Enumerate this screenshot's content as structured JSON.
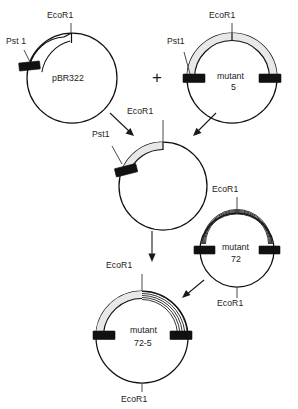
{
  "figure": {
    "operator": "+",
    "colors": {
      "line": "#111111",
      "band_shaded": "#e8e8e8",
      "pst_box": "#111111",
      "background": "#ffffff"
    }
  },
  "plasmids": [
    {
      "id": "pbr322",
      "name": "pBR322",
      "name_line1": "pBR322",
      "name_line2": "",
      "center": {
        "x": 72,
        "y": 78
      },
      "radius": 45,
      "sites": [
        {
          "label": "EcoR1",
          "position": "top"
        },
        {
          "label": "Pst 1",
          "position": "left"
        }
      ],
      "band": {
        "style": "double-line",
        "from": "pst1",
        "to": "ecor1"
      }
    },
    {
      "id": "mutant5",
      "name": "mutant 5",
      "name_line1": "mutant",
      "name_line2": "5",
      "center": {
        "x": 232,
        "y": 78
      },
      "radius": 45,
      "sites": [
        {
          "label": "EcoR1",
          "position": "top"
        },
        {
          "label": "Pst1",
          "position": "left"
        }
      ],
      "band": {
        "style": "shaded",
        "from": "pst1-left",
        "to": "pst1-right"
      }
    },
    {
      "id": "hybrid-intermediate",
      "name": "",
      "name_line1": "",
      "name_line2": "",
      "center": {
        "x": 163,
        "y": 186
      },
      "radius": 44,
      "sites": [
        {
          "label": "EcoR1",
          "position": "top"
        },
        {
          "label": "Pst1",
          "position": "upper-left"
        }
      ],
      "band": {
        "style": "shaded",
        "from": "pst1",
        "to": "ecor1"
      }
    },
    {
      "id": "mutant72",
      "name": "mutant 72",
      "name_line1": "mutant",
      "name_line2": "72",
      "center": {
        "x": 237,
        "y": 250
      },
      "radius": 37,
      "sites": [
        {
          "label": "EcoR1",
          "position": "top"
        },
        {
          "label": "EcoR1",
          "position": "bottom"
        }
      ],
      "band": {
        "style": "striped",
        "from": "pst1-left",
        "to": "pst1-right"
      }
    },
    {
      "id": "mutant72-5",
      "name": "mutant 72-5",
      "name_line1": "mutant",
      "name_line2": "72-5",
      "center": {
        "x": 142,
        "y": 337
      },
      "radius": 46,
      "sites": [
        {
          "label": "EcoR1",
          "position": "top"
        },
        {
          "label": "EcoR1",
          "position": "bottom"
        }
      ],
      "band": {
        "style": "shaded+striped",
        "from": "pst1-left",
        "to": "pst1-right"
      }
    }
  ],
  "labels": {
    "ecor1": "EcoR1",
    "pst1": "Pst1",
    "pst1_spaced": "Pst 1",
    "mutant": "mutant",
    "pbr322": "pBR322",
    "num5": "5",
    "num72": "72",
    "num72_5": "72-5",
    "plus": "+"
  },
  "label_instances": [
    {
      "key": "ecor1_pbr322_top",
      "text": "EcoR1",
      "x": 47,
      "y": 18
    },
    {
      "key": "pst1_pbr322_left",
      "text": "Pst 1",
      "x": 6,
      "y": 44
    },
    {
      "key": "name_pbr322",
      "text": "pBR322",
      "x": 52,
      "y": 81
    },
    {
      "key": "plus_operator",
      "text": "+",
      "x": 152,
      "y": 83
    },
    {
      "key": "ecor1_mutant5_top",
      "text": "EcoR1",
      "x": 209,
      "y": 18
    },
    {
      "key": "pst1_mutant5_left",
      "text": "Pst1",
      "x": 167,
      "y": 44
    },
    {
      "key": "name_mutant5_l1",
      "text": "mutant",
      "x": 217,
      "y": 79
    },
    {
      "key": "name_mutant5_l2",
      "text": "5",
      "x": 231,
      "y": 90
    },
    {
      "key": "ecor1_hybrid_top",
      "text": "EcoR1",
      "x": 127,
      "y": 114
    },
    {
      "key": "pst1_hybrid_left",
      "text": "Pst1",
      "x": 92,
      "y": 137
    },
    {
      "key": "ecor1_mutant72_top",
      "text": "EcoR1",
      "x": 212,
      "y": 190
    },
    {
      "key": "name_mutant72_l1",
      "text": "mutant",
      "x": 222,
      "y": 250
    },
    {
      "key": "name_mutant72_l2",
      "text": "72",
      "x": 231,
      "y": 261
    },
    {
      "key": "ecor1_mutant72_bot",
      "text": "EcoR1",
      "x": 217,
      "y": 302
    },
    {
      "key": "ecor1_final_top",
      "text": "EcoR1",
      "x": 106,
      "y": 265
    },
    {
      "key": "name_final_l1",
      "text": "mutant",
      "x": 130,
      "y": 331
    },
    {
      "key": "name_final_l2",
      "text": "72-5",
      "x": 134,
      "y": 345
    },
    {
      "key": "ecor1_final_bot",
      "text": "EcoR1",
      "x": 121,
      "y": 398
    }
  ],
  "arrows": [
    {
      "id": "pbr322-to-hybrid",
      "from": "pBR322",
      "to": "hybrid",
      "x1": 110,
      "y1": 113,
      "x2": 133,
      "y2": 135
    },
    {
      "id": "mutant5-to-hybrid",
      "from": "mutant 5",
      "to": "hybrid",
      "x1": 215,
      "y1": 113,
      "x2": 193,
      "y2": 135
    },
    {
      "id": "hybrid-to-final",
      "from": "hybrid",
      "to": "mutant 72-5",
      "x1": 152,
      "y1": 232,
      "x2": 152,
      "y2": 260
    },
    {
      "id": "mutant72-to-final",
      "from": "mutant 72",
      "to": "mutant 72-5",
      "x1": 203,
      "y1": 281,
      "x2": 183,
      "y2": 297
    }
  ]
}
